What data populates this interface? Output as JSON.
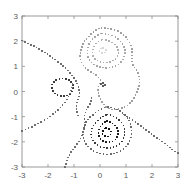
{
  "figure": {
    "background_color": "#ffffff",
    "axes_color": "#808080",
    "tick_label_color": "#595959",
    "width": 192,
    "height": 196
  },
  "axes": {
    "box": {
      "left": 22,
      "top": 16,
      "right": 178,
      "bottom": 167
    },
    "x_ticks": [
      "-3",
      "-2",
      "-1",
      "0",
      "1",
      "2",
      "3"
    ],
    "y_ticks": [
      "3",
      "2",
      "1",
      "0",
      "-1",
      "-2",
      "-3"
    ],
    "x_tick_values": [
      -3,
      -2,
      -1,
      0,
      1,
      2,
      3
    ],
    "y_tick_values": [
      3,
      2,
      1,
      0,
      -1,
      -2,
      -3
    ],
    "xlim": [
      -3,
      3
    ],
    "ylim": [
      -3,
      3
    ],
    "xlabel": "",
    "ylabel": "",
    "title": ""
  },
  "chart_data": {
    "type": "line",
    "title": "",
    "xlabel": "",
    "ylabel": "",
    "xlim": [
      -3,
      3
    ],
    "ylim": [
      -3,
      3
    ],
    "grid": false,
    "legend": "none",
    "marker": "dotted-square",
    "marker_size": 1.6,
    "series": [
      {
        "name": "contour-outer-upper-lobe",
        "color": "#a0a0a0",
        "closed": true,
        "points": [
          [
            0.05,
            2.52
          ],
          [
            0.45,
            2.48
          ],
          [
            0.8,
            2.33
          ],
          [
            1.05,
            2.08
          ],
          [
            1.2,
            1.8
          ],
          [
            1.24,
            1.5
          ],
          [
            1.22,
            1.22
          ],
          [
            1.3,
            1.0
          ],
          [
            1.45,
            0.78
          ],
          [
            1.52,
            0.5
          ],
          [
            1.5,
            0.2
          ],
          [
            1.4,
            -0.08
          ],
          [
            1.24,
            -0.35
          ],
          [
            1.05,
            -0.55
          ],
          [
            0.8,
            -0.68
          ],
          [
            0.55,
            -0.72
          ],
          [
            0.32,
            -0.66
          ],
          [
            0.15,
            -0.52
          ],
          [
            0.02,
            -0.32
          ],
          [
            -0.06,
            -0.08
          ],
          [
            -0.06,
            0.18
          ],
          [
            0.02,
            0.42
          ],
          [
            -0.12,
            0.62
          ],
          [
            -0.35,
            0.78
          ],
          [
            -0.58,
            0.96
          ],
          [
            -0.72,
            1.18
          ],
          [
            -0.76,
            1.44
          ],
          [
            -0.72,
            1.72
          ],
          [
            -0.6,
            1.98
          ],
          [
            -0.42,
            2.2
          ],
          [
            -0.2,
            2.4
          ],
          [
            0.05,
            2.52
          ]
        ]
      },
      {
        "name": "contour-mid-upper-lobe",
        "color": "#a8a8a8",
        "closed": true,
        "points": [
          [
            0.08,
            2.3
          ],
          [
            0.4,
            2.25
          ],
          [
            0.68,
            2.1
          ],
          [
            0.86,
            1.9
          ],
          [
            0.95,
            1.66
          ],
          [
            0.94,
            1.42
          ],
          [
            0.85,
            1.22
          ],
          [
            0.68,
            1.06
          ],
          [
            0.46,
            0.97
          ],
          [
            0.22,
            0.94
          ],
          [
            -0.02,
            0.98
          ],
          [
            -0.24,
            1.08
          ],
          [
            -0.4,
            1.25
          ],
          [
            -0.48,
            1.46
          ],
          [
            -0.48,
            1.7
          ],
          [
            -0.4,
            1.94
          ],
          [
            -0.25,
            2.12
          ],
          [
            -0.06,
            2.25
          ],
          [
            0.08,
            2.3
          ]
        ]
      },
      {
        "name": "contour-inner-upper-lobe",
        "color": "#b0b0b0",
        "closed": true,
        "points": [
          [
            0.1,
            2.06
          ],
          [
            0.36,
            2.0
          ],
          [
            0.58,
            1.86
          ],
          [
            0.7,
            1.66
          ],
          [
            0.69,
            1.45
          ],
          [
            0.58,
            1.28
          ],
          [
            0.38,
            1.18
          ],
          [
            0.14,
            1.15
          ],
          [
            -0.08,
            1.22
          ],
          [
            -0.24,
            1.36
          ],
          [
            -0.29,
            1.56
          ],
          [
            -0.24,
            1.78
          ],
          [
            -0.1,
            1.96
          ],
          [
            0.1,
            2.06
          ]
        ]
      },
      {
        "name": "contour-core-upper-lobe",
        "color": "#d8d8d8",
        "closed": true,
        "points": [
          [
            0.12,
            1.72
          ],
          [
            0.22,
            1.66
          ],
          [
            0.2,
            1.56
          ],
          [
            0.08,
            1.52
          ],
          [
            -0.01,
            1.58
          ],
          [
            0.0,
            1.68
          ],
          [
            0.12,
            1.72
          ]
        ]
      },
      {
        "name": "contour-small-left-ring",
        "color": "#3a3a3a",
        "closed": true,
        "points": [
          [
            -1.44,
            0.52
          ],
          [
            -1.2,
            0.46
          ],
          [
            -1.06,
            0.3
          ],
          [
            -1.04,
            0.1
          ],
          [
            -1.14,
            -0.08
          ],
          [
            -1.32,
            -0.18
          ],
          [
            -1.54,
            -0.18
          ],
          [
            -1.74,
            -0.08
          ],
          [
            -1.85,
            0.1
          ],
          [
            -1.83,
            0.3
          ],
          [
            -1.7,
            0.46
          ],
          [
            -1.44,
            0.52
          ]
        ]
      },
      {
        "name": "contour-tiny-center-ring",
        "color": "#5a5a5a",
        "closed": true,
        "points": [
          [
            0.12,
            0.34
          ],
          [
            0.19,
            0.31
          ],
          [
            0.19,
            0.24
          ],
          [
            0.12,
            0.21
          ],
          [
            0.05,
            0.24
          ],
          [
            0.05,
            0.31
          ],
          [
            0.12,
            0.34
          ]
        ]
      },
      {
        "name": "contour-outer-lower-basin",
        "color": "#6a6a6a",
        "closed": true,
        "points": [
          [
            0.3,
            -0.62
          ],
          [
            0.62,
            -0.7
          ],
          [
            0.9,
            -0.88
          ],
          [
            1.1,
            -1.12
          ],
          [
            1.2,
            -1.42
          ],
          [
            1.2,
            -1.74
          ],
          [
            1.1,
            -2.04
          ],
          [
            0.9,
            -2.28
          ],
          [
            0.62,
            -2.44
          ],
          [
            0.3,
            -2.5
          ],
          [
            -0.02,
            -2.46
          ],
          [
            -0.3,
            -2.32
          ],
          [
            -0.52,
            -2.1
          ],
          [
            -0.64,
            -1.82
          ],
          [
            -0.64,
            -1.52
          ],
          [
            -0.54,
            -1.24
          ],
          [
            -0.36,
            -1.0
          ],
          [
            -0.12,
            -0.8
          ],
          [
            0.08,
            -0.68
          ],
          [
            0.3,
            -0.62
          ]
        ]
      },
      {
        "name": "contour-mid-lower-basin",
        "color": "#3a3a3a",
        "closed": true,
        "points": [
          [
            0.28,
            -0.92
          ],
          [
            0.58,
            -1.02
          ],
          [
            0.8,
            -1.2
          ],
          [
            0.93,
            -1.44
          ],
          [
            0.94,
            -1.72
          ],
          [
            0.84,
            -1.98
          ],
          [
            0.64,
            -2.16
          ],
          [
            0.38,
            -2.24
          ],
          [
            0.1,
            -2.22
          ],
          [
            -0.14,
            -2.1
          ],
          [
            -0.3,
            -1.9
          ],
          [
            -0.34,
            -1.66
          ],
          [
            -0.28,
            -1.42
          ],
          [
            -0.14,
            -1.2
          ],
          [
            0.06,
            -1.03
          ],
          [
            0.28,
            -0.92
          ]
        ]
      },
      {
        "name": "contour-inner-lower-basin",
        "color": "#1e1e1e",
        "closed": true,
        "points": [
          [
            0.26,
            -1.18
          ],
          [
            0.5,
            -1.28
          ],
          [
            0.66,
            -1.46
          ],
          [
            0.7,
            -1.68
          ],
          [
            0.62,
            -1.88
          ],
          [
            0.44,
            -2.0
          ],
          [
            0.22,
            -2.0
          ],
          [
            0.03,
            -1.9
          ],
          [
            -0.06,
            -1.72
          ],
          [
            -0.03,
            -1.5
          ],
          [
            0.09,
            -1.3
          ],
          [
            0.26,
            -1.18
          ]
        ]
      },
      {
        "name": "contour-core-lower-basin",
        "color": "#111111",
        "closed": true,
        "points": [
          [
            0.24,
            -1.44
          ],
          [
            0.38,
            -1.52
          ],
          [
            0.42,
            -1.66
          ],
          [
            0.34,
            -1.77
          ],
          [
            0.2,
            -1.78
          ],
          [
            0.1,
            -1.68
          ],
          [
            0.12,
            -1.54
          ],
          [
            0.24,
            -1.44
          ]
        ]
      },
      {
        "name": "contour-open-upper-left-ridge",
        "color": "#6f6f6f",
        "closed": false,
        "points": [
          [
            -3.0,
            2.02
          ],
          [
            -2.7,
            1.88
          ],
          [
            -2.4,
            1.72
          ],
          [
            -2.1,
            1.54
          ],
          [
            -1.82,
            1.34
          ],
          [
            -1.56,
            1.14
          ],
          [
            -1.34,
            0.94
          ],
          [
            -1.14,
            0.72
          ],
          [
            -0.98,
            0.5
          ],
          [
            -0.86,
            0.28
          ],
          [
            -0.8,
            0.06
          ],
          [
            -0.8,
            -0.16
          ],
          [
            -0.86,
            -0.38
          ],
          [
            -0.9,
            -0.6
          ],
          [
            -0.88,
            -0.82
          ],
          [
            -0.82,
            -1.02
          ]
        ]
      },
      {
        "name": "contour-open-left-lower-ridge",
        "color": "#6f6f6f",
        "closed": false,
        "points": [
          [
            -3.0,
            -1.56
          ],
          [
            -2.7,
            -1.44
          ],
          [
            -2.42,
            -1.3
          ],
          [
            -2.14,
            -1.14
          ],
          [
            -1.88,
            -0.96
          ],
          [
            -1.64,
            -0.76
          ],
          [
            -1.44,
            -0.54
          ],
          [
            -1.28,
            -0.32
          ],
          [
            -1.16,
            -0.08
          ],
          [
            -1.08,
            0.16
          ],
          [
            -1.06,
            0.4
          ]
        ]
      },
      {
        "name": "contour-open-lower-left-tail",
        "color": "#6f6f6f",
        "closed": false,
        "points": [
          [
            -1.34,
            -3.0
          ],
          [
            -1.26,
            -2.72
          ],
          [
            -1.14,
            -2.46
          ],
          [
            -0.98,
            -2.22
          ],
          [
            -0.82,
            -2.0
          ],
          [
            -0.7,
            -1.76
          ],
          [
            -0.62,
            -1.52
          ],
          [
            -0.6,
            -1.28
          ],
          [
            -0.6,
            -1.04
          ],
          [
            -0.56,
            -0.82
          ],
          [
            -0.46,
            -0.62
          ],
          [
            -0.36,
            -0.44
          ],
          [
            -0.32,
            -0.24
          ]
        ]
      },
      {
        "name": "contour-open-lower-right-tail",
        "color": "#6f6f6f",
        "closed": false,
        "points": [
          [
            0.92,
            -0.92
          ],
          [
            1.14,
            -1.06
          ],
          [
            1.36,
            -1.22
          ],
          [
            1.6,
            -1.4
          ],
          [
            1.84,
            -1.58
          ],
          [
            2.08,
            -1.76
          ],
          [
            2.32,
            -1.94
          ],
          [
            2.56,
            -2.12
          ],
          [
            2.78,
            -2.3
          ],
          [
            3.0,
            -2.46
          ]
        ]
      }
    ]
  }
}
